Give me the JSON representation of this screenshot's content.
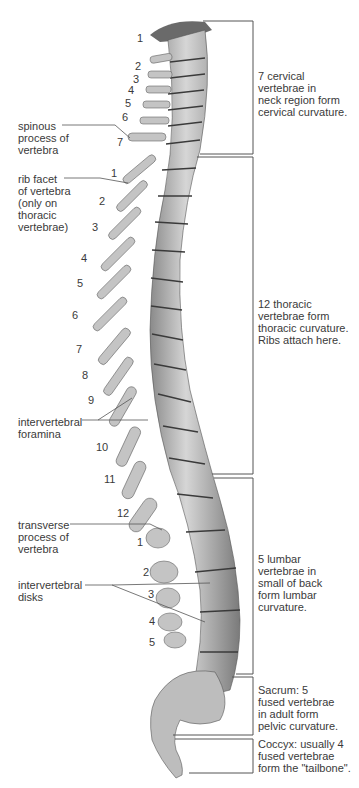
{
  "diagram": {
    "left_labels": [
      {
        "id": "spinous",
        "text": "spinous\nprocess of\nvertebra",
        "x": 18,
        "y": 120
      },
      {
        "id": "rib-facet",
        "text": "rib facet\nof vertebra\n(only on\nthoracic\nvertebrae)",
        "x": 18,
        "y": 173
      },
      {
        "id": "foramina",
        "text": "intervertebral\nforamina",
        "x": 18,
        "y": 416
      },
      {
        "id": "transverse",
        "text": "transverse\nprocess of\nvertebra",
        "x": 18,
        "y": 519
      },
      {
        "id": "disks",
        "text": "intervertebral\ndisks",
        "x": 18,
        "y": 579
      }
    ],
    "right_labels": [
      {
        "id": "cervical",
        "text": "7 cervical\nvertebrae in\nneck region form\ncervical curvature.",
        "x": 258,
        "y": 70
      },
      {
        "id": "thoracic",
        "text": "12 thoracic\nvertebrae form\nthoracic curvature.\nRibs attach here.",
        "x": 258,
        "y": 298
      },
      {
        "id": "lumbar",
        "text": "5 lumbar\nvertebrae in\nsmall of back\nform lumbar\ncurvature.",
        "x": 258,
        "y": 553
      },
      {
        "id": "sacrum",
        "text": "Sacrum: 5\nfused vertebrae\nin adult form\npelvic curvature.",
        "x": 258,
        "y": 684
      },
      {
        "id": "coccyx",
        "text": "Coccyx: usually 4\nfused vertebrae\nform the \"tailbone\".",
        "x": 258,
        "y": 738
      }
    ],
    "cervical_numbers": [
      {
        "n": "1",
        "x": 137,
        "y": 32
      },
      {
        "n": "2",
        "x": 135,
        "y": 60
      },
      {
        "n": "3",
        "x": 133,
        "y": 73
      },
      {
        "n": "4",
        "x": 128,
        "y": 84
      },
      {
        "n": "5",
        "x": 125,
        "y": 97
      },
      {
        "n": "6",
        "x": 122,
        "y": 111
      },
      {
        "n": "7",
        "x": 117,
        "y": 136
      }
    ],
    "thoracic_numbers": [
      {
        "n": "1",
        "x": 111,
        "y": 167
      },
      {
        "n": "2",
        "x": 99,
        "y": 195
      },
      {
        "n": "3",
        "x": 92,
        "y": 221
      },
      {
        "n": "4",
        "x": 81,
        "y": 252
      },
      {
        "n": "5",
        "x": 77,
        "y": 277
      },
      {
        "n": "6",
        "x": 72,
        "y": 309
      },
      {
        "n": "7",
        "x": 76,
        "y": 343
      },
      {
        "n": "8",
        "x": 82,
        "y": 369
      },
      {
        "n": "9",
        "x": 88,
        "y": 394
      },
      {
        "n": "10",
        "x": 96,
        "y": 441
      },
      {
        "n": "11",
        "x": 104,
        "y": 473
      },
      {
        "n": "12",
        "x": 117,
        "y": 507
      }
    ],
    "lumbar_numbers": [
      {
        "n": "1",
        "x": 137,
        "y": 536
      },
      {
        "n": "2",
        "x": 143,
        "y": 566
      },
      {
        "n": "3",
        "x": 148,
        "y": 588
      },
      {
        "n": "4",
        "x": 149,
        "y": 615
      },
      {
        "n": "5",
        "x": 149,
        "y": 636
      }
    ],
    "colors": {
      "bone": "#bdbdbd",
      "bone_dark": "#6e6e6e",
      "line": "#555555",
      "text": "#3a3a3a"
    }
  }
}
